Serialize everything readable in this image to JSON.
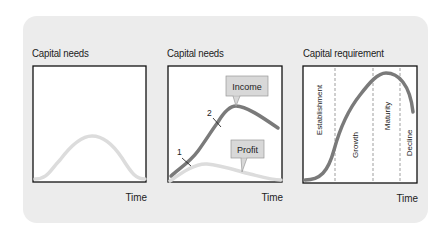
{
  "panels": [
    {
      "title": "Capital needs",
      "x_label": "Time",
      "curves": [
        {
          "name": "capital-needs",
          "color": "#dcdcdc"
        }
      ]
    },
    {
      "title": "Capital needs",
      "x_label": "Time",
      "curves": [
        {
          "name": "income",
          "color": "#7a7a7a",
          "callout": "Income"
        },
        {
          "name": "profit",
          "color": "#dcdcdc",
          "callout": "Profit"
        }
      ],
      "markers": [
        "1",
        "2"
      ]
    },
    {
      "title": "Capital requirement",
      "x_label": "Time",
      "curves": [
        {
          "name": "capital-requirement",
          "color": "#7a7a7a"
        }
      ],
      "phases": [
        "Establishment",
        "Growth",
        "Maturity",
        "Decline"
      ]
    }
  ],
  "colors": {
    "card_background": "#ececec",
    "box_border": "#111111",
    "dark_curve": "#7a7a7a",
    "light_curve": "#dcdcdc",
    "callout_fill": "#d8d8d8"
  }
}
